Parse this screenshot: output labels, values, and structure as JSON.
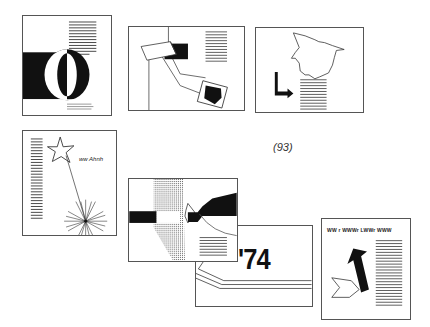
{
  "page": {
    "page_number": "(93)"
  },
  "thumbnails": [
    {
      "id": "o-letter",
      "description": "Half-black page with large letter O and text columns",
      "caption_lines": 3
    },
    {
      "id": "collage-arrow",
      "description": "Collage with black shapes connected by lines and text block",
      "text_lines": 13
    },
    {
      "id": "map-arrow",
      "description": "Map outline with bent black arrow pointing to text block",
      "text_lines": 11
    },
    {
      "id": "star-burst",
      "description": "Star outline with burst lines and text column",
      "label": "ww Ahnh"
    },
    {
      "id": "black-wave",
      "description": "Black band with arrow into curved black shape over dotted column",
      "text_lines": 9
    },
    {
      "id": "year-74",
      "description": "Diagonal layout with large year numeral",
      "year": "'74"
    },
    {
      "id": "up-arrow",
      "description": "Bold upward arrow with chevron and text column",
      "headline": "WW r WWWr LWWr WWW"
    }
  ]
}
